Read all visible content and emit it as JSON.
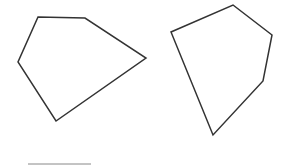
{
  "canvas": {
    "width": 288,
    "height": 167,
    "background": "#ffffff"
  },
  "shapes": {
    "left_polygon": {
      "type": "pentagon",
      "points": "38,17 85,18 146,58 56,121 18,62",
      "stroke": "#333333",
      "stroke_width": 1.5,
      "fill": "none"
    },
    "right_polygon": {
      "type": "pentagon",
      "points": "233,5 272,35 263,81 213,135 171,32",
      "stroke": "#333333",
      "stroke_width": 1.5,
      "fill": "none"
    },
    "baseline": {
      "type": "line",
      "x1": 28,
      "y1": 164,
      "x2": 91,
      "y2": 164,
      "stroke": "#888888",
      "stroke_width": 1
    }
  }
}
